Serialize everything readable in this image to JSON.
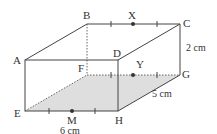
{
  "diagram": {
    "type": "cuboid",
    "vertices": {
      "A": "A",
      "B": "B",
      "C": "C",
      "D": "D",
      "E": "E",
      "F": "F",
      "G": "G",
      "H": "H"
    },
    "midpoints": {
      "X": "X",
      "Y": "Y",
      "M": "M"
    },
    "dimensions": {
      "length": "6 cm",
      "depth": "5 cm",
      "height": "2 cm"
    },
    "colors": {
      "edge": "#444444",
      "shaded_plane": "#d9d9d9"
    }
  }
}
